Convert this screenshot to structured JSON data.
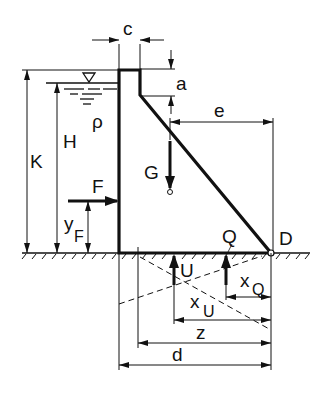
{
  "diagram": {
    "colors": {
      "ink": "#111111",
      "background": "#ffffff"
    },
    "labels": {
      "c": "c",
      "a": "a",
      "e": "e",
      "rho": "ρ",
      "H": "H",
      "K": "K",
      "G": "G",
      "F": "F",
      "yF_main": "y",
      "yF_sub": "F",
      "Q": "Q",
      "D": "D",
      "U": "U",
      "xQ_main": "x",
      "xQ_sub": "Q",
      "xU_main": "x",
      "xU_sub": "U",
      "z": "z",
      "d": "d",
      "water_level_symbol": "▽"
    },
    "elements": {
      "dam_profile": "Dam body with vertical upstream face, crest width c, vertical downstream section of height a, then sloped face to toe D",
      "water": "Reservoir on upstream side with depth H and density ρ",
      "forces": [
        "F (hydrostatic, horizontal)",
        "G (weight, downward)",
        "U (uplift, upward)",
        "Q (upward reaction)"
      ],
      "dimensions": [
        "c",
        "a",
        "e",
        "H",
        "K",
        "y_F",
        "x_Q",
        "x_U",
        "z",
        "d"
      ],
      "point": "D (toe of dam, pivot point)"
    }
  }
}
